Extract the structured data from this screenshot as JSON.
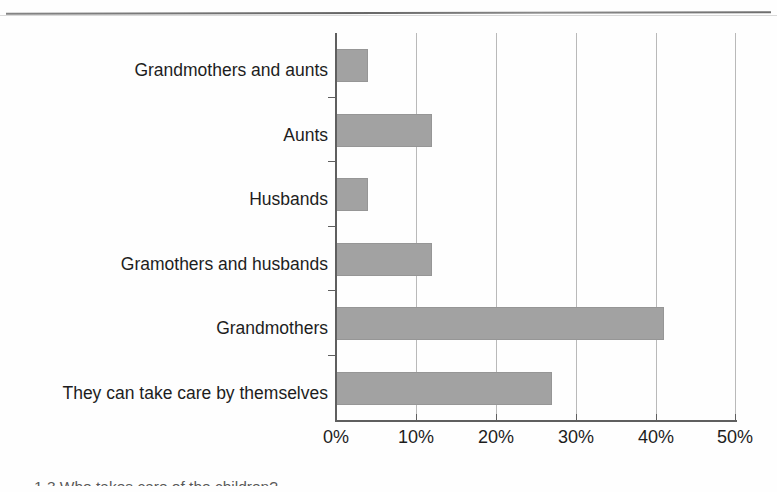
{
  "page": {
    "background_color": "#fefefe",
    "rule_color": "#5a5a5a"
  },
  "chart_data": {
    "type": "bar",
    "orientation": "horizontal",
    "title": "",
    "subtitle": "",
    "xlabel": "",
    "ylabel": "",
    "categories": [
      "Grandmothers and aunts",
      "Aunts",
      "Husbands",
      "Gramothers and husbands",
      "Grandmothers",
      "They can take care by themselves"
    ],
    "values": [
      4,
      12,
      4,
      12,
      41,
      27
    ],
    "value_unit": "%",
    "xlim": [
      0,
      50
    ],
    "xticks": [
      0,
      10,
      20,
      30,
      40,
      50
    ],
    "xtick_labels": [
      "0%",
      "10%",
      "20%",
      "30%",
      "40%",
      "50%"
    ],
    "grid": true,
    "grid_axis": "x",
    "legend": false,
    "legend_position": "none",
    "bar_color": "#a2a2a2",
    "axis_color": "#5f5f5f",
    "gridline_color": "#b9b9b9"
  },
  "caption": {
    "text": "1.3  Who takes care of the children?"
  }
}
